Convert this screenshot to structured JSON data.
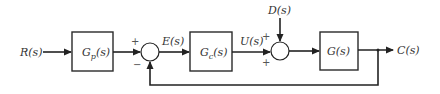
{
  "diagram": {
    "type": "control-system-block-diagram",
    "signals": {
      "input": "R(s)",
      "error": "E(s)",
      "control": "U(s)",
      "disturbance": "D(s)",
      "output": "C(s)"
    },
    "blocks": [
      {
        "id": "prefilter",
        "label": "Gp(s)",
        "main": "G",
        "sub": "p",
        "tail": "(s)"
      },
      {
        "id": "controller",
        "label": "Gc(s)",
        "main": "G",
        "sub": "c",
        "tail": "(s)"
      },
      {
        "id": "plant",
        "label": "G(s)",
        "main": "G(s)"
      }
    ],
    "summing_junctions": [
      {
        "id": "sum1",
        "top_sign": "+",
        "bottom_sign": "−"
      },
      {
        "id": "sum2",
        "top_sign": "+",
        "bottom_sign": "+"
      }
    ],
    "feedback": "unity negative feedback from C(s) to sum1"
  }
}
